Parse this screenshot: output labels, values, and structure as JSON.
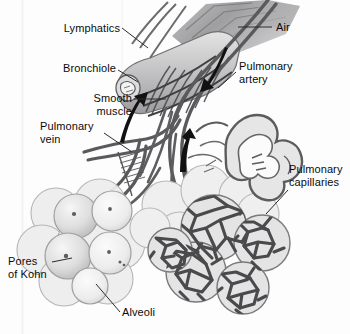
{
  "figure": {
    "type": "anatomical-illustration",
    "background_color": "#fdfdfd",
    "ink_color": "#0b0b0b",
    "palette": {
      "vessel_dark": "#58585a",
      "vessel_mid": "#7c7c7f",
      "alveoli_fill": "#e9e9e9",
      "alveoli_shade": "#cfcfcf",
      "airway_gray": "#9a9a9c",
      "capillary_mesh": "#4d4d50",
      "arrow_black": "#111111",
      "leader_line": "#2b2b2b"
    }
  },
  "labels": [
    {
      "id": "lymphatics",
      "text": "Lymphatics",
      "align": "right",
      "x": 60,
      "y": 22,
      "lines": [
        "Lymphatics"
      ]
    },
    {
      "id": "bronchiole",
      "text": "Bronchiole",
      "align": "right",
      "x": 56,
      "y": 62,
      "lines": [
        "Bronchiole"
      ]
    },
    {
      "id": "smooth-muscle",
      "text": "Smooth muscle",
      "align": "right",
      "x": 72,
      "y": 92,
      "lines": [
        "Smooth",
        "muscle"
      ]
    },
    {
      "id": "pulmonary-vein",
      "text": "Pulmonary vein",
      "align": "left",
      "x": 44,
      "y": 120,
      "lines": [
        "Pulmonary",
        "vein"
      ]
    },
    {
      "id": "pores-of-kohn",
      "text": "Pores of Kohn",
      "align": "left",
      "x": 9,
      "y": 255,
      "lines": [
        "Pores",
        "of Kohn"
      ]
    },
    {
      "id": "alveoli",
      "text": "Alveoli",
      "align": "left",
      "x": 122,
      "y": 313,
      "lines": [
        "Alveoli"
      ]
    },
    {
      "id": "air",
      "text": "Air",
      "align": "left",
      "x": 275,
      "y": 22,
      "lines": [
        "Air"
      ]
    },
    {
      "id": "pulmonary-artery",
      "text": "Pulmonary artery",
      "align": "left",
      "x": 238,
      "y": 64,
      "lines": [
        "Pulmonary",
        "artery"
      ]
    },
    {
      "id": "pulmonary-capillaries",
      "text": "Pulmonary capillaries",
      "align": "left",
      "x": 290,
      "y": 168,
      "lines": [
        "Pulmonary",
        "capillaries"
      ]
    }
  ],
  "arrows": [
    {
      "id": "air-in-arrow",
      "direction": "up-right",
      "meaning": "airflow along bronchiole"
    },
    {
      "id": "artery-flow-arrow",
      "direction": "down-left",
      "meaning": "blood flow into pulmonary artery"
    },
    {
      "id": "vein-flow-arrow",
      "direction": "up",
      "meaning": "blood flow out via pulmonary vein"
    }
  ],
  "structures": [
    {
      "id": "bronchiole-tube",
      "name": "Bronchiole"
    },
    {
      "id": "smooth-muscle-bands",
      "name": "Smooth muscle bands"
    },
    {
      "id": "lymphatic-vessels",
      "name": "Lymphatic vessels"
    },
    {
      "id": "pulmonary-artery-vessel",
      "name": "Pulmonary artery"
    },
    {
      "id": "pulmonary-vein-vessel",
      "name": "Pulmonary vein"
    },
    {
      "id": "alveolar-cluster-left",
      "name": "Alveolar cluster (cut, showing pores of Kohn)"
    },
    {
      "id": "alveolar-cluster-right",
      "name": "Alveolar cluster with capillary network"
    },
    {
      "id": "capillary-mesh",
      "name": "Pulmonary capillary network"
    },
    {
      "id": "alveolar-duct-cutaway",
      "name": "Alveolar duct cutaway"
    }
  ]
}
